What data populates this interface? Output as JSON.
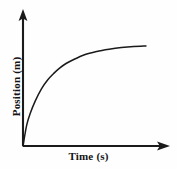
{
  "figure": {
    "background_color": "#fefefe",
    "ink_color": "#1a1a1a"
  },
  "axes": {
    "x_label": "Time (s)",
    "y_label": "Position (m)",
    "x_arrow_icon": "arrow-right-icon",
    "y_arrow_icon": "arrow-up-icon"
  },
  "chart_data": {
    "type": "line",
    "title": "",
    "xlabel": "Time (s)",
    "ylabel": "Position (m)",
    "xlim": [
      0,
      10
    ],
    "ylim": [
      0,
      10
    ],
    "grid": false,
    "legend": null,
    "tick_labels": {
      "x": [],
      "y": []
    },
    "annotations": [],
    "series": [
      {
        "name": "Position vs Time",
        "color": "#1a1a1a",
        "x": [
          0.0,
          0.3,
          0.6,
          1.0,
          1.5,
          2.0,
          2.5,
          3.0,
          3.5,
          4.0,
          5.0,
          6.0,
          7.0,
          8.0,
          9.0,
          10.0
        ],
        "y": [
          0.0,
          1.9,
          3.0,
          4.1,
          5.2,
          6.0,
          6.6,
          7.1,
          7.5,
          7.8,
          8.3,
          8.6,
          8.8,
          8.95,
          9.05,
          9.1
        ]
      }
    ]
  }
}
